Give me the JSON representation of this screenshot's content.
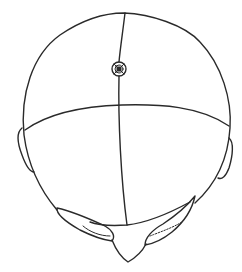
{
  "figure": {
    "caption": "",
    "colors": {
      "line": "#2a2a2a",
      "background": "#ffffff"
    },
    "marker": {
      "label": "",
      "cx": 119,
      "cy": 69,
      "r": 7
    }
  }
}
